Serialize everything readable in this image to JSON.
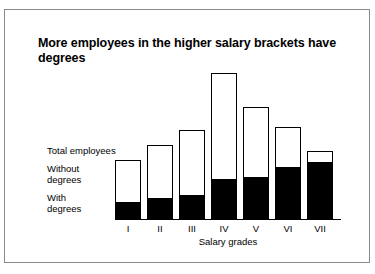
{
  "chart_data": {
    "type": "bar",
    "subtype": "stacked",
    "title": "More employees in the higher salary brackets have degrees",
    "xlabel": "Salary grades",
    "ylabel": "",
    "categories": [
      "I",
      "II",
      "III",
      "IV",
      "V",
      "VI",
      "VII"
    ],
    "series": [
      {
        "name": "With degrees",
        "color": "#000000",
        "values": [
          16,
          20,
          23,
          39,
          41,
          51,
          56
        ]
      },
      {
        "name": "Without degrees",
        "color": "#ffffff",
        "values": [
          43,
          54,
          66,
          107,
          71,
          41,
          12
        ]
      }
    ],
    "totals": {
      "name": "Total employees",
      "values": [
        59,
        74,
        89,
        146,
        112,
        92,
        68
      ]
    },
    "ylim": [
      0,
      158
    ],
    "grid": false,
    "legend_position": "left-inline",
    "annotations": [
      "Total employees",
      "Without degrees",
      "With degrees"
    ]
  },
  "labels": {
    "total_employees": "Total employees",
    "without_degrees_line1": "Without",
    "without_degrees_line2": "degrees",
    "with_degrees_line1": "With",
    "with_degrees_line2": "degrees"
  },
  "colors": {
    "with_degrees": "#000000",
    "without_degrees": "#ffffff",
    "bar_outline": "#000000",
    "frame": "#8a8a8a",
    "text": "#000000",
    "background": "#ffffff"
  }
}
